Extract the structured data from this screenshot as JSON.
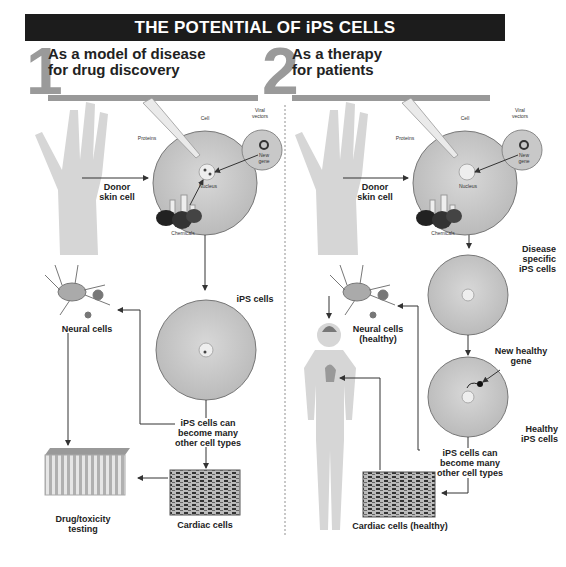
{
  "title": "THE POTENTIAL OF iPS CELLS",
  "sections": [
    {
      "number": "1",
      "title_line1": "As a model of disease",
      "title_line2": "for drug discovery",
      "labels": {
        "donor_line1": "Donor",
        "donor_line2": "skin cell",
        "proteins": "Proteins",
        "cell": "Cell",
        "viral_vectors_line1": "Viral",
        "viral_vectors_line2": "vectors",
        "new_gene_line1": "New",
        "new_gene_line2": "gene",
        "nucleus": "Nucleus",
        "chemicals": "Chemicals",
        "ips_cells": "iPS cells",
        "neural_cells": "Neural cells",
        "become_line1": "iPS cells can",
        "become_line2": "become many",
        "become_line3": "other cell types",
        "cardiac_cells": "Cardiac cells",
        "drug_line1": "Drug/toxicity",
        "drug_line2": "testing"
      }
    },
    {
      "number": "2",
      "title_line1": "As a therapy",
      "title_line2": "for patients",
      "labels": {
        "donor_line1": "Donor",
        "donor_line2": "skin cell",
        "proteins": "Proteins",
        "cell": "Cell",
        "viral_vectors_line1": "Viral",
        "viral_vectors_line2": "vectors",
        "new_gene_line1": "New",
        "new_gene_line2": "gene",
        "nucleus": "Nucleus",
        "chemicals": "Chemicals",
        "disease_line1": "Disease",
        "disease_line2": "specific",
        "disease_line3": "iPS cells",
        "new_healthy_line1": "New healthy",
        "new_healthy_line2": "gene",
        "healthy_line1": "Healthy",
        "healthy_line2": "iPS cells",
        "neural_line1": "Neural cells",
        "neural_line2": "(healthy)",
        "become_line1": "iPS cells can",
        "become_line2": "become many",
        "become_line3": "other cell types",
        "cardiac_healthy": "Cardiac cells (healthy)"
      }
    }
  ],
  "colors": {
    "title_bg": "#1c1c1c",
    "accent_gray": "#9a9a9a",
    "cell_fill": "#c9c9c9",
    "skin_fill": "#d6d6d6"
  }
}
